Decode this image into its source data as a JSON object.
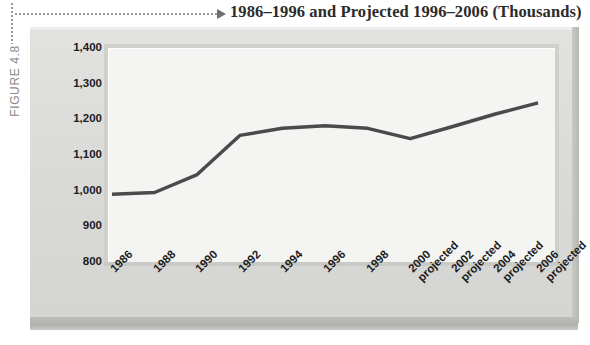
{
  "figure": {
    "label": "FIGURE 4.8",
    "title": "1986–1996 and Projected 1996–2006 (Thousands)"
  },
  "chart_data": {
    "type": "line",
    "title": "1986–1996 and Projected 1996–2006 (Thousands)",
    "xlabel": "",
    "ylabel": "",
    "ylim": [
      800,
      1400
    ],
    "yticks": [
      1400,
      1300,
      1200,
      1100,
      1000,
      900,
      800
    ],
    "ytick_labels": [
      "1,400",
      "1,300",
      "1,200",
      "1,100",
      "1,000",
      "900",
      "800"
    ],
    "grid": false,
    "legend": "none",
    "line_color": "#4a4a4a",
    "categories": [
      "1986",
      "1988",
      "1990",
      "1992",
      "1994",
      "1996",
      "1998",
      "2000",
      "2002",
      "2004",
      "2006"
    ],
    "category_notes": [
      "",
      "",
      "",
      "",
      "",
      "",
      "",
      "projected",
      "projected",
      "projected",
      "projected"
    ],
    "values": [
      990,
      995,
      1045,
      1155,
      1175,
      1182,
      1175,
      1146,
      1180,
      1215,
      1246
    ]
  }
}
